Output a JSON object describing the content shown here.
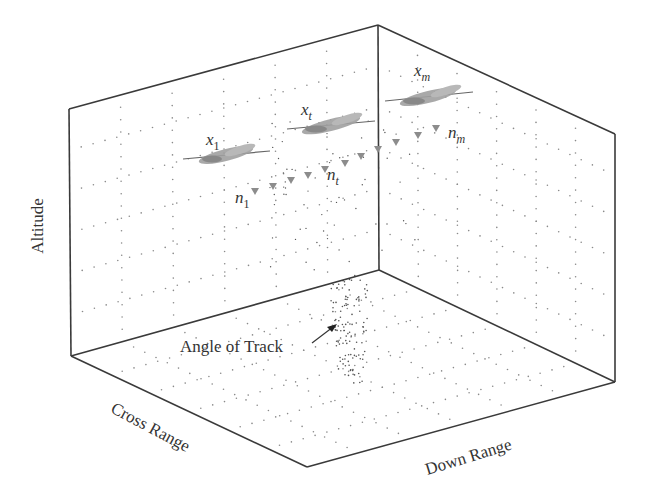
{
  "figure": {
    "type": "3d-box-diagram",
    "axes": {
      "vertical": "Altitude",
      "left_floor": "Cross Range",
      "right_floor": "Down Range"
    },
    "annotation": "Angle of Track",
    "targets": [
      {
        "state": "x",
        "sub": "1",
        "noise": "n",
        "noise_sub": "1"
      },
      {
        "state": "x",
        "sub": "t",
        "noise": "n",
        "noise_sub": "t"
      },
      {
        "state": "x",
        "sub": "m",
        "noise": "n",
        "noise_sub": "m"
      }
    ],
    "colors": {
      "frame": "#333333",
      "grid_dots": "#777777",
      "aircraft": "#9a9a9a",
      "arrowheads": "#8c8c8c",
      "text": "#333333"
    }
  },
  "chart_data": {
    "type": "scatter",
    "title": "",
    "xlabel": "Down Range",
    "ylabel": "Cross Range",
    "zlabel": "Altitude",
    "annotations": [
      "Angle of Track",
      "x1",
      "xt",
      "xm",
      "n1",
      "nt",
      "nm"
    ],
    "grid": true,
    "series": [
      {
        "name": "aircraft track states",
        "values": [
          "x_1",
          "x_t",
          "x_m"
        ]
      },
      {
        "name": "noise vectors",
        "values": [
          "n_1",
          "n_t",
          "n_m"
        ]
      }
    ]
  }
}
